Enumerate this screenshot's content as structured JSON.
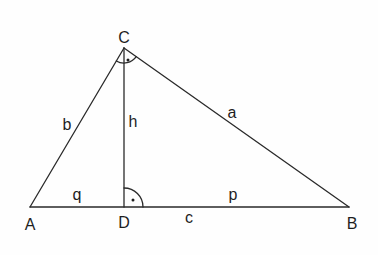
{
  "diagram": {
    "colors": {
      "stroke": "#2a2a2a",
      "text": "#1e1e1e",
      "background": "#fefefe"
    },
    "vertices": {
      "A": {
        "label": "A",
        "x": 30,
        "y": 207
      },
      "B": {
        "label": "B",
        "x": 349,
        "y": 207
      },
      "C": {
        "label": "C",
        "x": 124,
        "y": 48
      },
      "D": {
        "label": "D",
        "x": 124,
        "y": 207
      }
    },
    "segments": {
      "a": {
        "label": "a",
        "from": "B",
        "to": "C"
      },
      "b": {
        "label": "b",
        "from": "A",
        "to": "C"
      },
      "c": {
        "label": "c",
        "from": "A",
        "to": "B"
      },
      "h": {
        "label": "h",
        "from": "C",
        "to": "D"
      },
      "p": {
        "label": "p",
        "from": "D",
        "to": "B"
      },
      "q": {
        "label": "q",
        "from": "A",
        "to": "D"
      }
    },
    "right_angles": [
      "C",
      "D"
    ]
  }
}
